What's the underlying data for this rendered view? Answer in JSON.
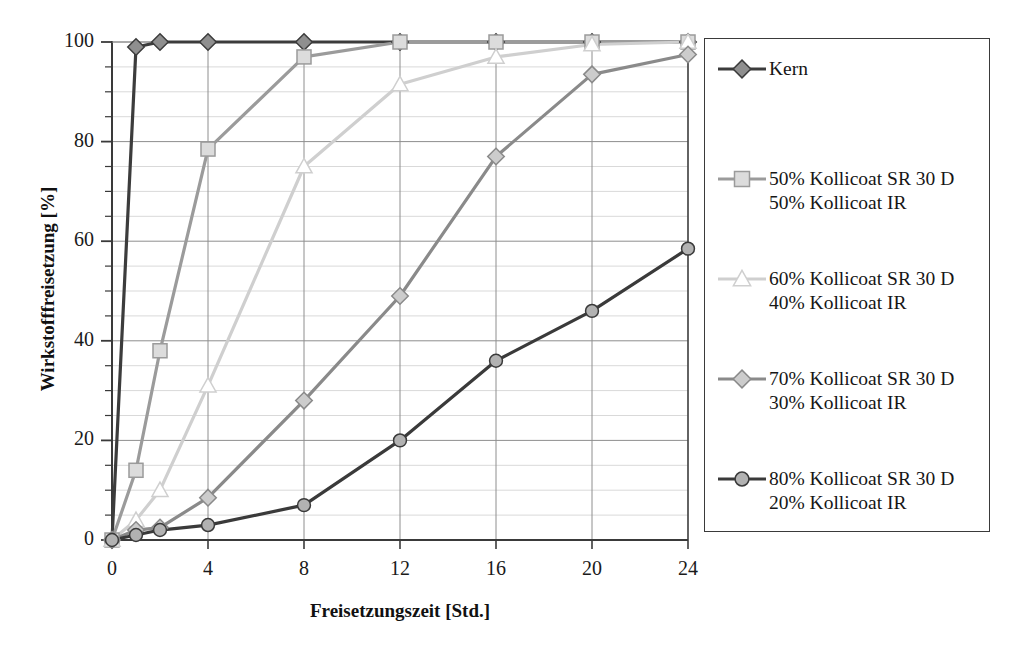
{
  "top_crop_text": "",
  "axes": {
    "y_title": "Wirkstofffreisetzung [%]",
    "x_title": "Freisetzungszeit [Std.]",
    "y_ticks": [
      "0",
      "20",
      "40",
      "60",
      "80",
      "100"
    ],
    "x_ticks": [
      "0",
      "4",
      "8",
      "12",
      "16",
      "20",
      "24"
    ]
  },
  "legend": {
    "items": [
      {
        "label": "Kern",
        "marker": "diamond-dark-icon",
        "color": "#7d7d7d",
        "line": "#3c3c3c"
      },
      {
        "label": "50% Kollicoat SR 30 D\n50% Kollicoat IR",
        "marker": "square-light-icon",
        "color": "#d6d6d6",
        "line": "#9a9a9a"
      },
      {
        "label": "60% Kollicoat SR 30 D\n40% Kollicoat IR",
        "marker": "triangle-open-icon",
        "color": "#ffffff",
        "line": "#cfcfcf"
      },
      {
        "label": "70% Kollicoat SR 30 D\n30% Kollicoat IR",
        "marker": "diamond-grey-icon",
        "color": "#c9c9c9",
        "line": "#8c8c8c"
      },
      {
        "label": "80% Kollicoat SR 30 D\n20% Kollicoat IR",
        "marker": "circle-grey-icon",
        "color": "#b0b0b0",
        "line": "#3a3a3a"
      }
    ]
  },
  "chart_data": {
    "type": "line",
    "title": "",
    "xlabel": "Freisetzungszeit [Std.]",
    "ylabel": "Wirkstofffreisetzung [%]",
    "xlim": [
      0,
      24
    ],
    "ylim": [
      0,
      100
    ],
    "xticks": [
      0,
      4,
      8,
      12,
      16,
      20,
      24
    ],
    "yticks": [
      0,
      20,
      40,
      60,
      80,
      100
    ],
    "y_minor_step": 5,
    "grid": "major-x-and-y plus minor-y",
    "legend_position": "right-outside",
    "x": [
      0,
      1,
      2,
      4,
      8,
      12,
      16,
      20,
      24
    ],
    "series": [
      {
        "name": "Kern",
        "marker": "diamond",
        "fill": "#8f8f8f",
        "stroke": "#3c3c3c",
        "line_width": 3.2,
        "values": [
          0,
          99,
          100,
          100,
          100,
          100,
          100,
          100,
          100
        ]
      },
      {
        "name": "50% Kollicoat SR 30 D / 50% Kollicoat IR",
        "marker": "square",
        "fill": "#dcdcdc",
        "stroke": "#9b9b9b",
        "line_width": 3.2,
        "values": [
          0,
          14,
          38,
          78.5,
          97,
          100,
          100,
          100,
          100
        ]
      },
      {
        "name": "60% Kollicoat SR 30 D / 40% Kollicoat IR",
        "marker": "triangle",
        "fill": "#ffffff",
        "stroke": "#cfcfcf",
        "line_width": 3.2,
        "values": [
          0,
          4,
          10,
          31,
          75,
          91.5,
          97,
          99.5,
          100
        ]
      },
      {
        "name": "70% Kollicoat SR 30 D / 30% Kollicoat IR",
        "marker": "diamond",
        "fill": "#cccccc",
        "stroke": "#8a8a8a",
        "line_width": 3.2,
        "values": [
          0,
          2,
          2.5,
          8.5,
          28,
          49,
          77,
          93.5,
          97.5
        ]
      },
      {
        "name": "80% Kollicoat SR 30 D / 20% Kollicoat IR",
        "marker": "circle",
        "fill": "#b2b2b2",
        "stroke": "#3a3a3a",
        "line_width": 3.2,
        "values": [
          0,
          1,
          2,
          3,
          7,
          20,
          36,
          46,
          58.5
        ]
      }
    ]
  },
  "colors": {
    "axis": "#3a3a3a",
    "grid_major": "#8e8e8e",
    "grid_minor": "#d9d9d9",
    "background": "#ffffff"
  }
}
